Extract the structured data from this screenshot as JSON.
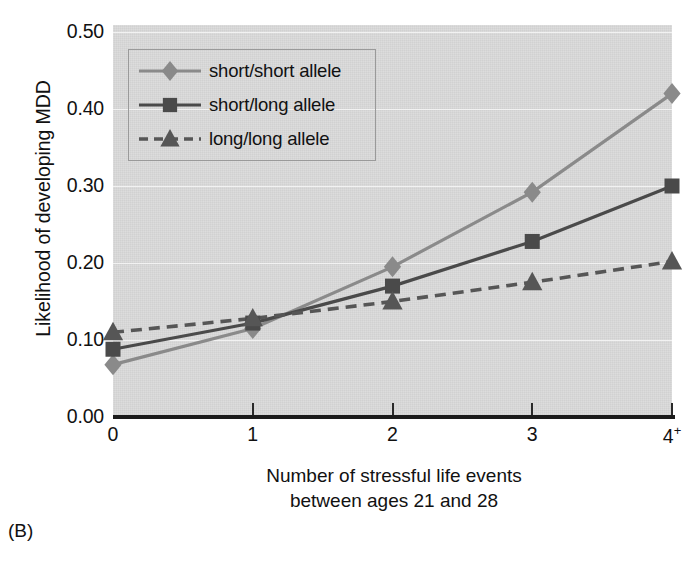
{
  "panel_label": "(B)",
  "chart_data": {
    "type": "line",
    "title": "",
    "xlabel_lines": [
      "Number of stressful life events",
      "between ages 21 and 28"
    ],
    "ylabel": "Likelihood of developing MDD",
    "categories": [
      "0",
      "1",
      "2",
      "3",
      "4+"
    ],
    "xtick_labels": [
      "0",
      "1",
      "2",
      "3",
      "4"
    ],
    "last_xtick_superscript": "+",
    "ytick_labels": [
      "0.00",
      "0.10",
      "0.20",
      "0.30",
      "0.40",
      "0.50"
    ],
    "ytick_values": [
      0.0,
      0.1,
      0.2,
      0.3,
      0.4,
      0.5
    ],
    "ylim": [
      0.0,
      0.5
    ],
    "grid": "horizontal",
    "legend_position": "upper-left-inside",
    "plot_background": "#d9d9d9",
    "series": [
      {
        "name": "short/short allele",
        "marker": "diamond",
        "linestyle": "solid",
        "color": "#8a8a8a",
        "values": [
          0.068,
          0.115,
          0.195,
          0.292,
          0.42
        ]
      },
      {
        "name": "short/long allele",
        "marker": "square",
        "linestyle": "solid",
        "color": "#4a4a4a",
        "values": [
          0.088,
          0.122,
          0.17,
          0.228,
          0.3
        ]
      },
      {
        "name": "long/long allele",
        "marker": "triangle",
        "linestyle": "dashed",
        "color": "#565656",
        "values": [
          0.11,
          0.128,
          0.15,
          0.175,
          0.202
        ]
      }
    ]
  }
}
